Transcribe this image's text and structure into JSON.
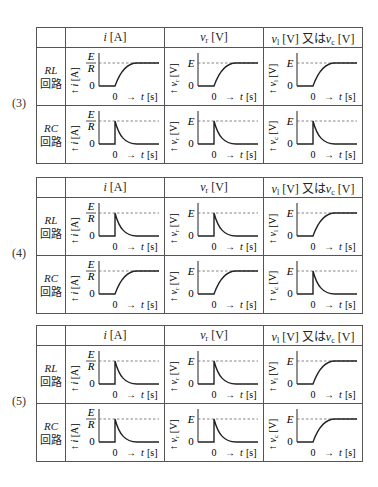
{
  "columns": {
    "blank": "",
    "c1": {
      "var": "i",
      "sub": "",
      "unit": "[A]"
    },
    "c2": {
      "var": "v",
      "sub": "r",
      "unit": "[V]"
    },
    "c3": {
      "var1": "v",
      "sub1": "l",
      "unit1": "[V]",
      "joiner": "又は",
      "var2": "v",
      "sub2": "c",
      "unit2": "[V]"
    }
  },
  "row_labels": {
    "RL": {
      "circuit": "RL",
      "suffix": "回路"
    },
    "RC": {
      "circuit": "RC",
      "suffix": "回路"
    }
  },
  "axis": {
    "zero": "0",
    "t_label": "0 → t [s]",
    "level_E": "E",
    "level_ER_num": "E",
    "level_ER_den": "R",
    "i_label": "↑ i [A]",
    "vr_label": "↑ vr [V]",
    "vl_label": "↑ vl [V]",
    "vc_label": "↑ vc [V]"
  },
  "options": [
    {
      "label": "(3)",
      "rows": [
        {
          "circuit": "RL",
          "curves": [
            "rise",
            "rise",
            "rise"
          ],
          "third_var": "vl"
        },
        {
          "circuit": "RC",
          "curves": [
            "decay",
            "decay",
            "decay"
          ],
          "third_var": "vc"
        }
      ]
    },
    {
      "label": "(4)",
      "rows": [
        {
          "circuit": "RL",
          "curves": [
            "decay",
            "decay",
            "rise"
          ],
          "third_var": "vl"
        },
        {
          "circuit": "RC",
          "curves": [
            "rise",
            "rise",
            "decay"
          ],
          "third_var": "vc"
        }
      ]
    },
    {
      "label": "(5)",
      "rows": [
        {
          "circuit": "RL",
          "curves": [
            "decay",
            "decay",
            "rise"
          ],
          "third_var": "vl"
        },
        {
          "circuit": "RC",
          "curves": [
            "decay",
            "decay",
            "rise"
          ],
          "third_var": "vc"
        }
      ]
    }
  ],
  "colors": {
    "line": "#222222",
    "border": "#555555",
    "dash": "#666666"
  }
}
